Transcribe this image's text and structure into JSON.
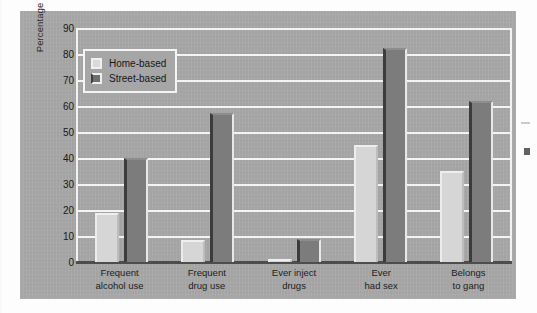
{
  "chart_data": {
    "type": "bar",
    "title": "",
    "xlabel": "",
    "ylabel": "Percentage Reporting",
    "ylim": [
      0,
      90
    ],
    "ytick_step": 10,
    "yticks": [
      90,
      80,
      70,
      60,
      50,
      40,
      30,
      20,
      10,
      0
    ],
    "grid": true,
    "grid_axis": "y",
    "legend_position": "top-left",
    "categories": [
      "Frequent alcohol use",
      "Frequent drug use",
      "Ever inject drugs",
      "Ever had sex",
      "Belongs to gang"
    ],
    "category_lines": [
      [
        "Frequent",
        "alcohol use"
      ],
      [
        "Frequent",
        "drug use"
      ],
      [
        "Ever inject",
        "drugs"
      ],
      [
        "Ever",
        "had sex"
      ],
      [
        "Belongs",
        "to gang"
      ]
    ],
    "series": [
      {
        "name": "Home-based",
        "color": "#d6d6d6",
        "values": [
          19,
          8.5,
          1,
          45,
          35
        ]
      },
      {
        "name": "Street-based",
        "color": "#7c7c7c",
        "values": [
          40,
          57.5,
          9,
          82.5,
          62
        ]
      }
    ]
  },
  "legend": {
    "items": [
      {
        "label": "Home-based",
        "swatch": "home"
      },
      {
        "label": "Street-based",
        "swatch": "street"
      }
    ]
  },
  "colors": {
    "panel_background": "#a8a8a8",
    "gridline": "#f4f4f4",
    "axis": "#4d4d4d",
    "home_based_bar": "#d6d6d6",
    "street_based_bar": "#7c7c7c",
    "text": "#1d1d1d"
  }
}
